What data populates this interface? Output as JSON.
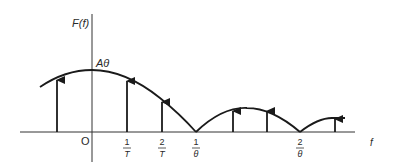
{
  "figure": {
    "y_axis_label": "F(f)",
    "x_axis_label": "f",
    "origin_label": "O",
    "peak_label": "Aθ",
    "ticks": [
      {
        "num": "1",
        "den": "T",
        "x": 127
      },
      {
        "num": "2",
        "den": "T",
        "x": 162
      },
      {
        "num": "1",
        "den": "θ",
        "x": 196
      },
      {
        "num": "2",
        "den": "θ",
        "x": 300
      }
    ],
    "line_color": "#1a1a1a",
    "axis_color": "#333333"
  },
  "diagram": {
    "envelope_lobes": [
      {
        "from": "-",
        "to": "1/θ",
        "peak": "Aθ"
      },
      {
        "from": "1/θ",
        "to": "2/θ"
      },
      {
        "from": "2/θ",
        "to": "-"
      }
    ],
    "arrows_x": [
      57,
      127,
      162,
      233,
      267,
      335
    ]
  }
}
